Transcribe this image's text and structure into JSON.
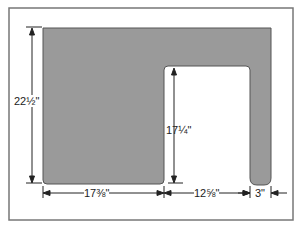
{
  "diagram": {
    "colors": {
      "panel_fill": "#9a9a9a",
      "frame": "#777777",
      "line": "#222222",
      "background": "#ffffff"
    },
    "dimensions": {
      "overall_height": "22½\"",
      "notch_height": "17¼\"",
      "left_width": "17⅜\"",
      "notch_width": "12⅝\"",
      "right_leg_width": "3\""
    }
  }
}
